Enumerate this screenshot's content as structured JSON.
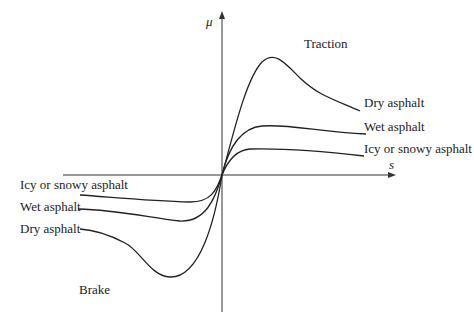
{
  "diagram": {
    "axes": {
      "y_label": "μ",
      "x_label": "s"
    },
    "regions": {
      "traction": "Traction",
      "brake": "Brake"
    },
    "traction_curves": [
      {
        "label": "Dry asphalt"
      },
      {
        "label": "Wet asphalt"
      },
      {
        "label": "Icy or snowy asphalt"
      }
    ],
    "brake_curves": [
      {
        "label": "Icy or snowy asphalt"
      },
      {
        "label": "Wet asphalt"
      },
      {
        "label": "Dry asphalt"
      }
    ]
  }
}
